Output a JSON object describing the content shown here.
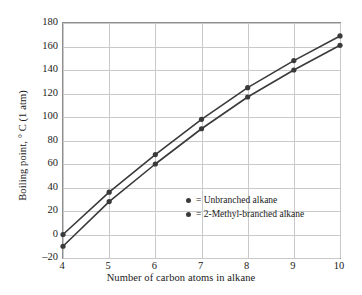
{
  "chart_data": {
    "type": "line",
    "title": "",
    "xlabel": "Number of carbon atoms in alkane",
    "ylabel": "Boiling point, ° C (1 atm)",
    "x": [
      4,
      5,
      6,
      7,
      8,
      9,
      10
    ],
    "xlim": [
      4,
      10
    ],
    "ylim": [
      -20,
      180
    ],
    "xticks": [
      "4",
      "5",
      "6",
      "7",
      "8",
      "9",
      "10"
    ],
    "yticks": [
      "180",
      "160",
      "140",
      "120",
      "100",
      "80",
      "60",
      "40",
      "20",
      "0",
      "–20"
    ],
    "ytick_values": [
      180,
      160,
      140,
      120,
      100,
      80,
      60,
      40,
      20,
      0,
      -20
    ],
    "grid": true,
    "legend_position": "inside-lower-right",
    "series": [
      {
        "name": "= Unbranched alkane",
        "values": [
          0,
          36,
          68,
          98,
          125,
          148,
          169
        ],
        "color": "#3a3a3a"
      },
      {
        "name": "= 2-Methyl-branched alkane",
        "values": [
          -10,
          28,
          60,
          90,
          117,
          140,
          161
        ],
        "color": "#3a3a3a"
      }
    ]
  },
  "legend": {
    "items": [
      {
        "label": "= Unbranched alkane",
        "marker": "filled-circle-marker"
      },
      {
        "label": "= 2-Methyl-branched alkane",
        "marker": "filled-circle-marker"
      }
    ]
  },
  "colors": {
    "line": "#3a3a3a",
    "grid": "#c9c9c9",
    "frame": "#8e8e8e",
    "text": "#1a1a1a",
    "background": "#ffffff"
  }
}
